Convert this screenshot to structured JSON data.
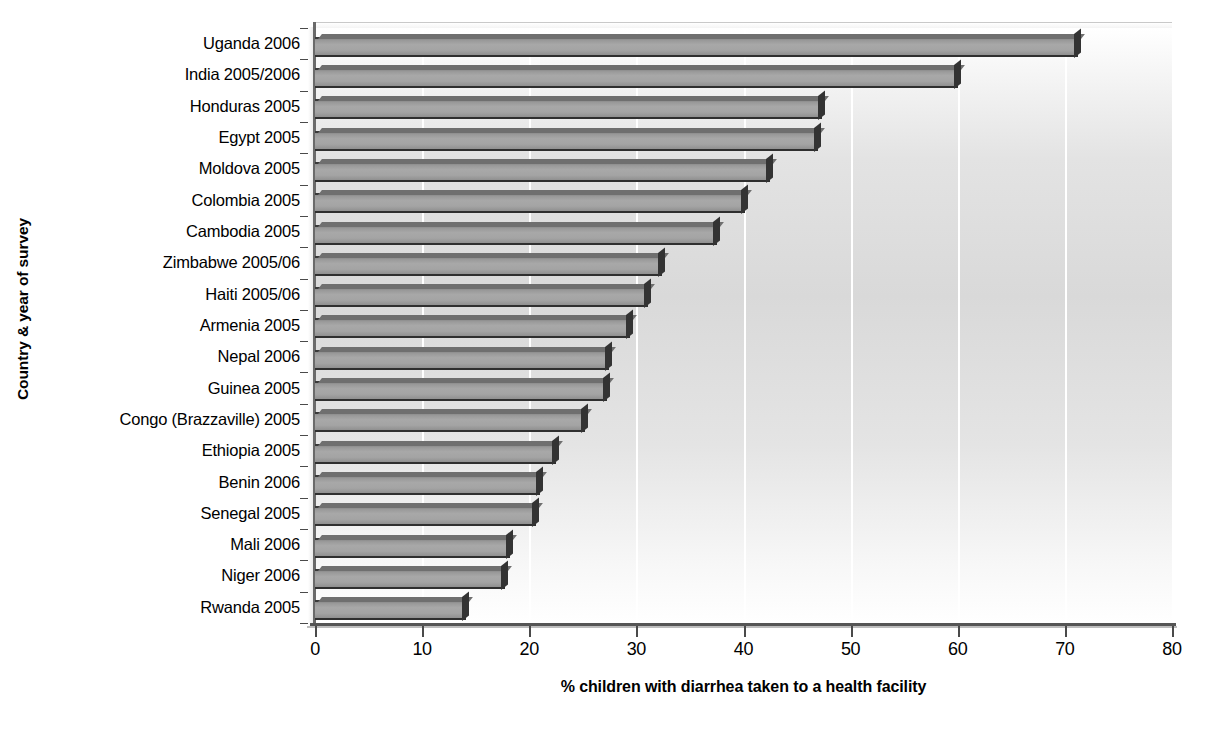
{
  "chart_data": {
    "type": "bar",
    "orientation": "horizontal",
    "title": "",
    "xlabel": "% children with diarrhea taken to a health facility",
    "ylabel": "Country & year of survey",
    "xlim": [
      0,
      80
    ],
    "xticks": [
      0,
      10,
      20,
      30,
      40,
      50,
      60,
      70,
      80
    ],
    "xtick_labels": [
      "0",
      "10",
      "20",
      "30",
      "40",
      "50",
      "60",
      "70",
      "80"
    ],
    "grid": "vertical-white-gridlines",
    "legend": "none",
    "categories": [
      "Uganda 2006",
      "India 2005/2006",
      "Honduras 2005",
      "Egypt 2005",
      "Moldova 2005",
      "Colombia 2005",
      "Cambodia 2005",
      "Zimbabwe 2005/06",
      "Haiti 2005/06",
      "Armenia 2005",
      "Nepal 2006",
      "Guinea 2005",
      "Congo (Brazzaville) 2005",
      "Ethiopia 2005",
      "Benin 2006",
      "Senegal 2005",
      "Mali 2006",
      "Niger 2006",
      "Rwanda 2005"
    ],
    "values": [
      71.2,
      60.0,
      47.3,
      47.0,
      42.5,
      40.1,
      37.5,
      32.4,
      31.1,
      29.4,
      27.4,
      27.3,
      25.2,
      22.5,
      21.0,
      20.6,
      18.2,
      17.7,
      14.1
    ],
    "series": [
      {
        "name": "% children with diarrhea taken to a health facility",
        "values": [
          71.2,
          60.0,
          47.3,
          47.0,
          42.5,
          40.1,
          37.5,
          32.4,
          31.1,
          29.4,
          27.4,
          27.3,
          25.2,
          22.5,
          21.0,
          20.6,
          18.2,
          17.7,
          14.1
        ]
      }
    ],
    "colors": {
      "bar_fill": "#a8a8a8",
      "bar_edge": "#333333",
      "plot_background": "#d9d9d9",
      "gridline": "#ffffff",
      "axis": "#4a4a4a",
      "text": "#000000"
    }
  }
}
